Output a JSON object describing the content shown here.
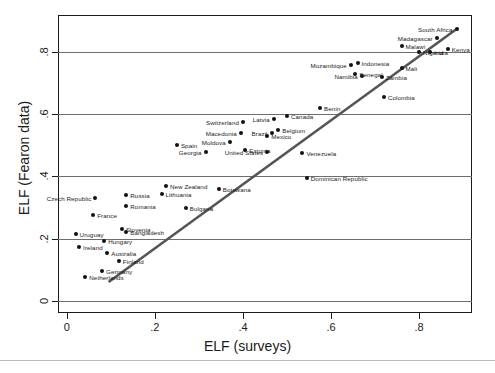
{
  "chart_data": {
    "type": "scatter",
    "title": "",
    "xlabel": "ELF (surveys)",
    "ylabel": "ELF (Fearon data)",
    "xlim": [
      -0.02,
      0.92
    ],
    "ylim": [
      -0.04,
      0.92
    ],
    "xticks": [
      "0",
      ".2",
      ".4",
      ".6",
      ".8"
    ],
    "xtick_values": [
      0,
      0.2,
      0.4,
      0.6,
      0.8
    ],
    "yticks": [
      "0",
      ".2",
      ".4",
      ".6",
      ".8"
    ],
    "ytick_values": [
      0,
      0.2,
      0.4,
      0.6,
      0.8
    ],
    "grid": "horizontal",
    "legend": "none",
    "reference_line": {
      "type": "45-degree-fit",
      "from": [
        0.095,
        0.06
      ],
      "to": [
        0.885,
        0.875
      ],
      "color": "#555555"
    },
    "points": [
      {
        "label": "South Africa",
        "x": 0.885,
        "y": 0.875,
        "side": "left"
      },
      {
        "label": "Madagascar",
        "x": 0.84,
        "y": 0.845,
        "side": "left"
      },
      {
        "label": "Malawi",
        "x": 0.76,
        "y": 0.82,
        "side": "right"
      },
      {
        "label": "Kenya",
        "x": 0.865,
        "y": 0.81,
        "side": "right"
      },
      {
        "label": "Nigeria",
        "x": 0.8,
        "y": 0.8,
        "side": "right"
      },
      {
        "label": "India",
        "x": 0.825,
        "y": 0.8,
        "side": "right"
      },
      {
        "label": "Indonesia",
        "x": 0.66,
        "y": 0.765,
        "side": "right"
      },
      {
        "label": "Mozambique",
        "x": 0.645,
        "y": 0.76,
        "side": "left"
      },
      {
        "label": "Mali",
        "x": 0.76,
        "y": 0.75,
        "side": "right"
      },
      {
        "label": "Senegal",
        "x": 0.655,
        "y": 0.73,
        "side": "right"
      },
      {
        "label": "Namibia",
        "x": 0.67,
        "y": 0.725,
        "side": "left"
      },
      {
        "label": "Zambia",
        "x": 0.715,
        "y": 0.72,
        "side": "right"
      },
      {
        "label": "Colombia",
        "x": 0.72,
        "y": 0.655,
        "side": "right"
      },
      {
        "label": "Benin",
        "x": 0.575,
        "y": 0.62,
        "side": "right"
      },
      {
        "label": "Latvia",
        "x": 0.47,
        "y": 0.585,
        "side": "left"
      },
      {
        "label": "Canada",
        "x": 0.5,
        "y": 0.595,
        "side": "right"
      },
      {
        "label": "Switzerland",
        "x": 0.4,
        "y": 0.575,
        "side": "left"
      },
      {
        "label": "Belgium",
        "x": 0.48,
        "y": 0.55,
        "side": "right"
      },
      {
        "label": "Brazil",
        "x": 0.465,
        "y": 0.54,
        "side": "left"
      },
      {
        "label": "Macedonia",
        "x": 0.395,
        "y": 0.54,
        "side": "left"
      },
      {
        "label": "Mexico",
        "x": 0.455,
        "y": 0.53,
        "side": "right"
      },
      {
        "label": "Moldova",
        "x": 0.37,
        "y": 0.51,
        "side": "left"
      },
      {
        "label": "Spain",
        "x": 0.25,
        "y": 0.5,
        "side": "right"
      },
      {
        "label": "Estonia",
        "x": 0.405,
        "y": 0.485,
        "side": "right"
      },
      {
        "label": "Georgia",
        "x": 0.315,
        "y": 0.48,
        "side": "left"
      },
      {
        "label": "United States",
        "x": 0.455,
        "y": 0.478,
        "side": "left"
      },
      {
        "label": "Venezuela",
        "x": 0.535,
        "y": 0.475,
        "side": "right"
      },
      {
        "label": "Dominican Republic",
        "x": 0.545,
        "y": 0.395,
        "side": "right"
      },
      {
        "label": "New Zealand",
        "x": 0.225,
        "y": 0.37,
        "side": "right"
      },
      {
        "label": "Botswana",
        "x": 0.345,
        "y": 0.36,
        "side": "right"
      },
      {
        "label": "Lithuania",
        "x": 0.215,
        "y": 0.345,
        "side": "right"
      },
      {
        "label": "Russia",
        "x": 0.135,
        "y": 0.34,
        "side": "right"
      },
      {
        "label": "Czech Republic",
        "x": 0.065,
        "y": 0.33,
        "side": "left"
      },
      {
        "label": "Romania",
        "x": 0.135,
        "y": 0.305,
        "side": "right"
      },
      {
        "label": "Bulgaria",
        "x": 0.27,
        "y": 0.3,
        "side": "right"
      },
      {
        "label": "France",
        "x": 0.06,
        "y": 0.275,
        "side": "right"
      },
      {
        "label": "Slovenia",
        "x": 0.125,
        "y": 0.23,
        "side": "right"
      },
      {
        "label": "Bangladesh",
        "x": 0.135,
        "y": 0.222,
        "side": "right"
      },
      {
        "label": "Uruguay",
        "x": 0.02,
        "y": 0.215,
        "side": "right"
      },
      {
        "label": "Hungary",
        "x": 0.085,
        "y": 0.192,
        "side": "right"
      },
      {
        "label": "Ireland",
        "x": 0.028,
        "y": 0.172,
        "side": "right"
      },
      {
        "label": "Australia",
        "x": 0.092,
        "y": 0.152,
        "side": "right"
      },
      {
        "label": "Finland",
        "x": 0.118,
        "y": 0.128,
        "side": "right"
      },
      {
        "label": "Germany",
        "x": 0.08,
        "y": 0.095,
        "side": "right"
      },
      {
        "label": "Netherlands",
        "x": 0.042,
        "y": 0.075,
        "side": "right"
      }
    ]
  }
}
